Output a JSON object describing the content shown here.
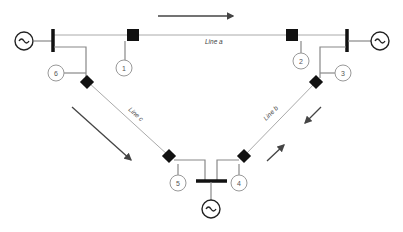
{
  "diagram": {
    "type": "power-system-one-line",
    "lines": [
      {
        "id": "a",
        "label": "Line a"
      },
      {
        "id": "b",
        "label": "Line b"
      },
      {
        "id": "c",
        "label": "Line c"
      }
    ],
    "nodes": [
      {
        "id": 1,
        "label": "1"
      },
      {
        "id": 2,
        "label": "2"
      },
      {
        "id": 3,
        "label": "3"
      },
      {
        "id": 4,
        "label": "4"
      },
      {
        "id": 5,
        "label": "5"
      },
      {
        "id": 6,
        "label": "6"
      }
    ],
    "generators": [
      {
        "id": "gen-left",
        "symbol": "~"
      },
      {
        "id": "gen-right",
        "symbol": "~"
      },
      {
        "id": "gen-bottom",
        "symbol": "~"
      }
    ],
    "colors": {
      "breaker": "#111111",
      "line": "#aaaaaa",
      "arrow": "#444444"
    }
  }
}
